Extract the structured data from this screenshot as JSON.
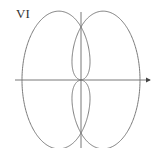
{
  "figure": {
    "label": "VI",
    "stroke_color": "#7a7a7a",
    "axis_color": "#6a6a6a"
  },
  "chart_data": {
    "type": "line",
    "title": "VI",
    "xlabel": "",
    "ylabel": "",
    "series": [
      {
        "name": "r = 1 + cos(theta)",
        "equation": "r = 1 + cos(theta)",
        "theta_range": [
          0,
          6.2832
        ]
      },
      {
        "name": "r = 1 - cos(theta)",
        "equation": "r = 1 - cos(theta)",
        "theta_range": [
          0,
          6.2832
        ]
      }
    ],
    "xlim": [
      -2.2,
      2.4
    ],
    "ylim": [
      -1.3,
      1.3
    ],
    "grid": false,
    "axes": "cartesian with arrow on positive x"
  }
}
